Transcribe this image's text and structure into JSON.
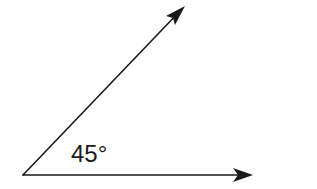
{
  "diagram": {
    "type": "angle",
    "angle_label": "45°",
    "angle_degrees": 45,
    "colors": {
      "stroke": "#1a1a1a",
      "background": "#ffffff",
      "text": "#1a1a1a"
    },
    "vertex": {
      "x": 23,
      "y": 175
    },
    "rays": [
      {
        "name": "horizontal-ray",
        "from": [
          23,
          175
        ],
        "to": [
          253,
          175
        ]
      },
      {
        "name": "diagonal-ray",
        "from": [
          23,
          175
        ],
        "to": [
          185,
          6
        ]
      }
    ]
  }
}
